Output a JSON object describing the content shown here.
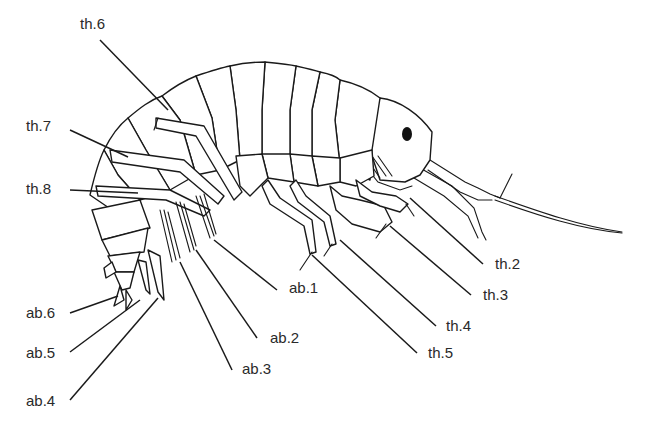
{
  "figure": {
    "colors": {
      "ink": "#1a1a1a",
      "label_text": "#2a2a2a",
      "background": "#ffffff"
    }
  },
  "labels": [
    {
      "id": "th6",
      "text": "th.6",
      "x": 80,
      "y": 18,
      "line": [
        100,
        40,
        168,
        110
      ]
    },
    {
      "id": "th7",
      "text": "th.7",
      "x": 26,
      "y": 120,
      "line": [
        70,
        130,
        128,
        157
      ]
    },
    {
      "id": "th8",
      "text": "th.8",
      "x": 26,
      "y": 183,
      "line": [
        70,
        190,
        138,
        193
      ]
    },
    {
      "id": "ab6",
      "text": "ab.6",
      "x": 26,
      "y": 307,
      "line": [
        70,
        313,
        118,
        296
      ]
    },
    {
      "id": "ab5",
      "text": "ab.5",
      "x": 26,
      "y": 347,
      "line": [
        70,
        352,
        140,
        300
      ]
    },
    {
      "id": "ab4",
      "text": "ab.4",
      "x": 26,
      "y": 395,
      "line": [
        70,
        400,
        158,
        298
      ]
    },
    {
      "id": "ab1",
      "text": "ab.1",
      "x": 289,
      "y": 282,
      "line": [
        277,
        290,
        214,
        240
      ]
    },
    {
      "id": "ab2",
      "text": "ab.2",
      "x": 270,
      "y": 332,
      "line": [
        257,
        338,
        196,
        250
      ]
    },
    {
      "id": "ab3",
      "text": "ab.3",
      "x": 242,
      "y": 363,
      "line": [
        232,
        370,
        180,
        262
      ]
    },
    {
      "id": "th2",
      "text": "th.2",
      "x": 495,
      "y": 258,
      "line": [
        483,
        264,
        410,
        198
      ]
    },
    {
      "id": "th3",
      "text": "th.3",
      "x": 483,
      "y": 289,
      "line": [
        471,
        295,
        390,
        226
      ]
    },
    {
      "id": "th4",
      "text": "th.4",
      "x": 446,
      "y": 320,
      "line": [
        436,
        326,
        340,
        240
      ]
    },
    {
      "id": "th5",
      "text": "th.5",
      "x": 428,
      "y": 347,
      "line": [
        417,
        353,
        312,
        255
      ]
    }
  ]
}
